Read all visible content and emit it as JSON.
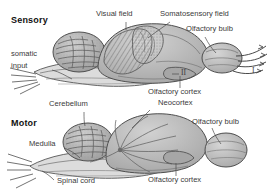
{
  "figure": {
    "title_sensory": "Sensory",
    "title_motor": "Motor",
    "background_color": "#ffffff",
    "ink_color": "#4a4a4a",
    "fill_light": "#d8d8d8",
    "fill_mid": "#bdbdbd",
    "fill_dark": "#9a9a9a"
  },
  "panels": [
    {
      "id": "sensory",
      "heading": "Sensory",
      "labels": [
        {
          "name": "somatic-input",
          "line1": "somatic",
          "line2": "input"
        },
        {
          "name": "visual-field",
          "text": "Visual field"
        },
        {
          "name": "somatosensory-field",
          "text": "Somatosensory field"
        },
        {
          "name": "olfactory-bulb",
          "text": "Olfactory bulb"
        },
        {
          "name": "olfactory-cortex",
          "text": "Olfactory cortex"
        },
        {
          "name": "cranial-nerve-two",
          "text": "II"
        },
        {
          "name": "cranial-nerve-one",
          "text": "I"
        }
      ]
    },
    {
      "id": "motor",
      "heading": "Motor",
      "labels": [
        {
          "name": "neocortex",
          "text": "Neocortex"
        },
        {
          "name": "cerebellum",
          "text": "Cerebellum"
        },
        {
          "name": "medulla",
          "text": "Medulla"
        },
        {
          "name": "spinal-cord",
          "text": "Spinal cord"
        },
        {
          "name": "olfactory-bulb",
          "text": "Olfactory bulb"
        },
        {
          "name": "olfactory-cortex",
          "text": "Olfactory cortex"
        }
      ]
    }
  ],
  "text": {
    "sensory_heading": "Sensory",
    "motor_heading": "Motor",
    "somatic": "somatic",
    "input": "input",
    "visual_field": "Visual field",
    "somatosensory_field": "Somatosensory field",
    "olfactory_bulb_top": "Olfactory bulb",
    "olfactory_cortex_top": "Olfactory cortex",
    "nerve_ii": "II",
    "nerve_i": "I",
    "neocortex": "Neocortex",
    "cerebellum": "Cerebellum",
    "medulla": "Medulla",
    "spinal_cord": "Spinal cord",
    "olfactory_bulb_bottom": "Olfactory bulb",
    "olfactory_cortex_bottom": "Olfactory cortex"
  }
}
